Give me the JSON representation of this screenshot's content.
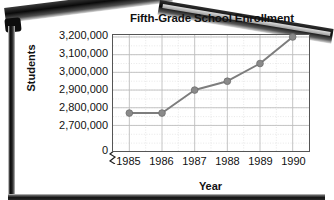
{
  "chart_data": {
    "type": "line",
    "title": "Fifth-Grade School Enrollment",
    "xlabel": "Year",
    "ylabel": "Students",
    "categories": [
      "1985",
      "1986",
      "1987",
      "1988",
      "1989",
      "1990"
    ],
    "values": [
      2770000,
      2770000,
      2900000,
      2950000,
      3050000,
      3200000
    ],
    "series": [
      {
        "name": "Fifth-grade enrollment",
        "values": [
          2770000,
          2770000,
          2900000,
          2950000,
          3050000,
          3200000
        ]
      }
    ],
    "ytick_labels": [
      "3,200,000",
      "3,100,000",
      "3,000,000",
      "2,900,000",
      "2,800,000",
      "2,700,000"
    ],
    "ytick_values": [
      3200000,
      3100000,
      3000000,
      2900000,
      2800000,
      2700000
    ],
    "y_origin_label": "0",
    "ylim": [
      2650000,
      3200000
    ],
    "axis_break": true,
    "grid": "major-solid-and-minor-dotted",
    "legend": "none",
    "line_color": "#7d7d7d",
    "marker_color": "#8a8a8a",
    "marker_shape": "circle",
    "grid_major_color": "#bdbdbd",
    "grid_minor_color": "#d8d8d8",
    "axis_color": "#555555",
    "text_color": "#111111",
    "background": "#ffffff"
  },
  "frame": {
    "style": "dark-board-frame",
    "color": "#0d0d0d"
  }
}
